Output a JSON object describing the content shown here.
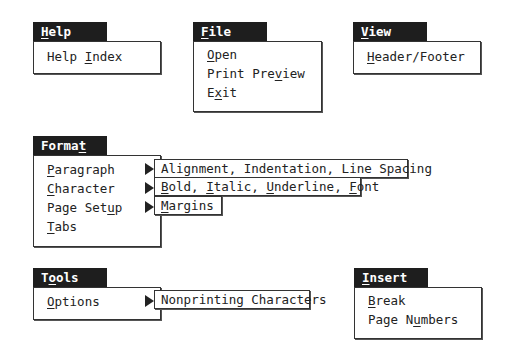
{
  "menus": {
    "help": {
      "title": {
        "pre": "",
        "ul": "H",
        "post": "elp"
      },
      "items": [
        {
          "pre": "Help ",
          "ul": "I",
          "post": "ndex"
        }
      ]
    },
    "file": {
      "title": {
        "pre": "",
        "ul": "F",
        "post": "ile"
      },
      "items": [
        {
          "pre": "",
          "ul": "O",
          "post": "pen"
        },
        {
          "pre": "Print Pre",
          "ul": "v",
          "post": "iew"
        },
        {
          "pre": "E",
          "ul": "x",
          "post": "it"
        }
      ]
    },
    "view": {
      "title": {
        "pre": "",
        "ul": "V",
        "post": "iew"
      },
      "items": [
        {
          "pre": "",
          "ul": "H",
          "post": "eader/Footer"
        }
      ]
    },
    "format": {
      "title": {
        "pre": "Forma",
        "ul": "t",
        "post": ""
      },
      "items": [
        {
          "pre": "",
          "ul": "P",
          "post": "aragraph",
          "submenu": "Alignment, Indentation, Line Spacing"
        },
        {
          "pre": "",
          "ul": "C",
          "post": "haracter"
        },
        {
          "pre": "Page Set",
          "ul": "u",
          "post": "p"
        },
        {
          "pre": "",
          "ul": "T",
          "post": "abs"
        }
      ],
      "submenus": {
        "paragraph": "Alignment, Indentation, Line Spacing",
        "character": [
          {
            "pre": "",
            "ul": "B",
            "post": "old, "
          },
          {
            "pre": "",
            "ul": "I",
            "post": "talic, "
          },
          {
            "pre": "",
            "ul": "U",
            "post": "nderline, "
          },
          {
            "pre": "",
            "ul": "F",
            "post": "ont"
          }
        ],
        "page_setup": {
          "pre": "",
          "ul": "M",
          "post": "argins"
        }
      }
    },
    "tools": {
      "title": {
        "pre": "T",
        "ul": "o",
        "post": "ols"
      },
      "items": [
        {
          "pre": "",
          "ul": "O",
          "post": "ptions"
        }
      ],
      "submenus": {
        "options": "Nonprinting Characters"
      }
    },
    "insert": {
      "title": {
        "pre": "",
        "ul": "I",
        "post": "nsert"
      },
      "items": [
        {
          "pre": "",
          "ul": "B",
          "post": "reak"
        },
        {
          "pre": "Page N",
          "ul": "u",
          "post": "mbers"
        }
      ]
    }
  },
  "icons": {
    "submenu_arrow": "right-triangle"
  },
  "colors": {
    "title_bg": "#1e1e1e",
    "title_fg": "#ffffff",
    "border": "#333333",
    "background": "#ffffff"
  }
}
